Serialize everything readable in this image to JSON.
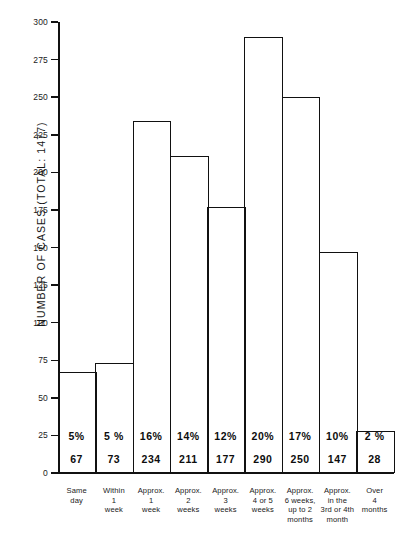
{
  "chart_data": {
    "type": "bar",
    "title": "",
    "subtitle": "",
    "xlabel": "",
    "ylabel": "NUMBER OF CASES   (TOTAL: 1477)",
    "ylim": [
      0,
      300
    ],
    "ytick_step": 25,
    "yticks": [
      "300",
      "275",
      "250",
      "225",
      "200",
      "175",
      "150",
      "125",
      "100",
      "75",
      "50",
      "25",
      "0"
    ],
    "ytick_values": [
      300,
      275,
      250,
      225,
      200,
      175,
      150,
      125,
      100,
      75,
      50,
      25,
      0
    ],
    "grid": false,
    "legend": null,
    "total_cases": 1477,
    "categories": [
      [
        "Same",
        "day"
      ],
      [
        "Within",
        "1",
        "week"
      ],
      [
        "Approx.",
        "1",
        "week"
      ],
      [
        "Approx.",
        "2",
        "weeks"
      ],
      [
        "Approx.",
        "3",
        "weeks"
      ],
      [
        "Approx.",
        "4 or 5",
        "weeks"
      ],
      [
        "Approx.",
        "6 weeks,",
        "up to 2",
        "months"
      ],
      [
        "Approx.",
        "in the",
        "3rd or 4th",
        "month"
      ],
      [
        "Over",
        "4",
        "months"
      ]
    ],
    "values": [
      67,
      73,
      234,
      211,
      177,
      290,
      250,
      147,
      28
    ],
    "percent_labels": [
      "5%",
      "5 %",
      "16%",
      "14%",
      "12%",
      "20%",
      "17%",
      "10%",
      "2 %"
    ],
    "value_labels": [
      "67",
      "73",
      "234",
      "211",
      "177",
      "290",
      "250",
      "147",
      "28"
    ],
    "colors": {
      "bar_stroke": "#111111",
      "bar_fill": "transparent",
      "axis": "#111111",
      "text": "#1a1a1a",
      "background": "#ffffff"
    }
  }
}
